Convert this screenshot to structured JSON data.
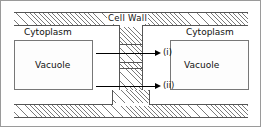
{
  "figure": {
    "labels": {
      "cell_wall": "Cell  Wall",
      "cytoplasm_left": "Cytoplasm",
      "cytoplasm_right": "Cytoplasm",
      "vacuole_left": "Vacuole",
      "vacuole_right": "Vacuole",
      "pathway_one": "(i)",
      "pathway_two": "(ii)"
    },
    "colors": {
      "line": "#555555",
      "hatch": "#7a7a7a",
      "stipple": "#e2e2e2",
      "arrow": "#000000",
      "background": "#ffffff",
      "frame": "#9a9a9a"
    }
  }
}
